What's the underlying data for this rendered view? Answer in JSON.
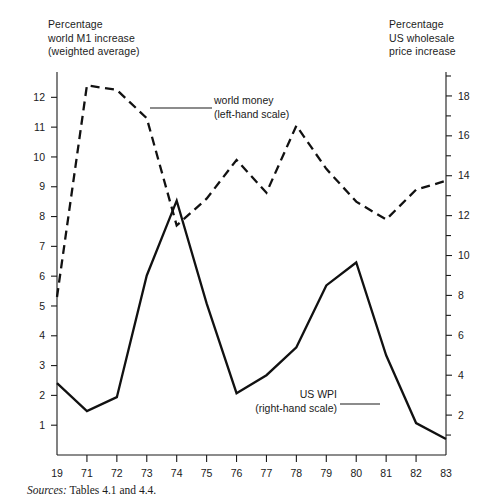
{
  "figure": {
    "left_caption": "Percentage\nworld M1 increase\n(weighted average)",
    "right_caption": "Percentage\nUS wholesale\nprice increase",
    "source_label": "Sources:",
    "source_text": " Tables 4.1 and 4.4."
  },
  "annotations": {
    "world_money": "world money\n(left-hand scale)",
    "world_money_line1": "world money",
    "world_money_line2": "(left-hand scale)",
    "us_wpi_line1": "US WPI",
    "us_wpi_line2": "(right-hand scale)"
  },
  "chart_data": {
    "type": "line",
    "title": "",
    "subtitle": "",
    "xlabel": "",
    "ylabel": "Percentage world M1 increase (weighted average)",
    "y2label": "Percentage US wholesale price increase",
    "grid": false,
    "legend_position": "inline-annotation",
    "x": [
      "19",
      "71",
      "72",
      "73",
      "74",
      "75",
      "76",
      "77",
      "78",
      "79",
      "80",
      "81",
      "82",
      "83"
    ],
    "x_tick_labels": [
      "19",
      "71",
      "72",
      "73",
      "74",
      "75",
      "76",
      "77",
      "78",
      "79",
      "80",
      "81",
      "82",
      "83"
    ],
    "ylim": [
      0,
      12.85
    ],
    "y_ticks": [
      1,
      2,
      3,
      4,
      5,
      6,
      7,
      8,
      9,
      10,
      11,
      12
    ],
    "y_tick_labels": [
      "1",
      "2",
      "3",
      "4",
      "5",
      "6",
      "7",
      "8",
      "9",
      "10",
      "11",
      "12"
    ],
    "y2lim": [
      0,
      19.2
    ],
    "y2_ticks": [
      2,
      4,
      6,
      8,
      10,
      12,
      14,
      16,
      18
    ],
    "y2_tick_labels": [
      "2",
      "4",
      "6",
      "8",
      "10",
      "12",
      "14",
      "16",
      "18"
    ],
    "y2_minor_ticks": [
      1,
      3,
      5,
      7,
      9,
      11,
      13,
      15,
      17,
      19
    ],
    "series": [
      {
        "name": "world money (left-hand scale)",
        "axis": "left",
        "style": "dashed",
        "color": "#111111",
        "values": [
          5.3,
          12.4,
          12.25,
          11.3,
          7.7,
          8.6,
          9.9,
          8.8,
          11.05,
          9.6,
          8.5,
          7.9,
          8.9,
          9.2
        ]
      },
      {
        "name": "US WPI (right-hand scale)",
        "axis": "right",
        "style": "solid",
        "color": "#111111",
        "values": [
          3.6,
          2.2,
          2.9,
          9.0,
          12.75,
          7.6,
          3.1,
          4.0,
          5.4,
          8.5,
          9.65,
          5.0,
          1.6,
          0.8
        ]
      }
    ]
  }
}
